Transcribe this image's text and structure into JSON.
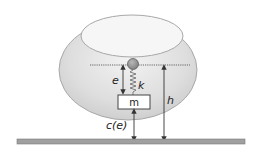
{
  "diagram": {
    "labels": {
      "e": "e",
      "k": "k",
      "m": "m",
      "h": "h",
      "c": "c(e)"
    },
    "colors": {
      "shell_fill": "#dcdcdc",
      "shell_stroke": "#a8a8a8",
      "ground": "#9a9a9a",
      "pivot": "#8c8c8c",
      "line": "#333333"
    }
  }
}
